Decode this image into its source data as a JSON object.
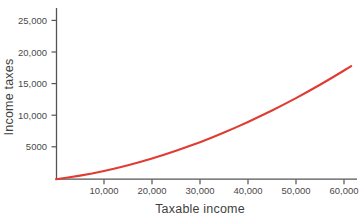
{
  "figure": {
    "background_color": "#ffffff",
    "width": 363,
    "height": 218
  },
  "chart_data": {
    "type": "line",
    "title": "",
    "subtitle": "",
    "xlabel": "Taxable income",
    "ylabel": "Income taxes",
    "xlim": [
      0,
      64000
    ],
    "ylim": [
      0,
      26500
    ],
    "grid": false,
    "legend": null,
    "legend_position": "none",
    "line_color": "#e03c33",
    "axis_color": "#555555",
    "xticks": [
      10000,
      20000,
      30000,
      40000,
      50000,
      60000
    ],
    "xtick_labels": [
      "10,000",
      "20,000",
      "30,000",
      "40,000",
      "50,000",
      "60,000"
    ],
    "yticks": [
      5000,
      10000,
      15000,
      20000,
      25000
    ],
    "ytick_labels": [
      "5000",
      "10,000",
      "15,000",
      "20,000",
      "25,000"
    ],
    "series": [
      {
        "name": "Income taxes",
        "x": [
          0,
          2500,
          5000,
          7500,
          10000,
          12500,
          15000,
          17500,
          20000,
          22500,
          25000,
          27500,
          30000,
          32500,
          35000,
          37500,
          40000,
          42500,
          45000,
          47500,
          50000,
          52500,
          55000,
          57500,
          60000,
          61500
        ],
        "y": [
          0,
          260,
          560,
          900,
          1290,
          1720,
          2190,
          2700,
          3250,
          3840,
          4470,
          5130,
          5830,
          6570,
          7350,
          8160,
          9010,
          9900,
          10820,
          11780,
          12770,
          13800,
          14870,
          15970,
          17110,
          17810
        ]
      }
    ],
    "annotations": []
  }
}
